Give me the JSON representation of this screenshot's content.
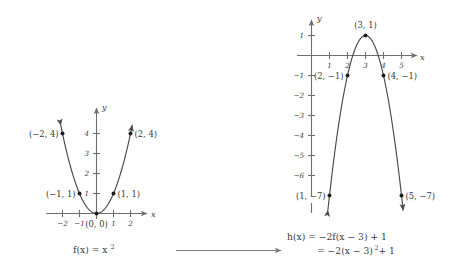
{
  "figure": {
    "background_color": "#ffffff",
    "ink_color": "#3a3a3a",
    "axis_color": "#6e6e6e",
    "curve_color": "#4a4a4a",
    "point_color": "#1d1d1d"
  },
  "chart_data": [
    {
      "id": "parent-parabola",
      "type": "line",
      "title": "f(x) = x^2",
      "caption": "f(x) = x²",
      "xlabel": "x",
      "ylabel": "y",
      "xlim": [
        -2.6,
        2.9
      ],
      "ylim": [
        -0.6,
        5.2
      ],
      "grid": false,
      "legend": "none",
      "equation": "f(x) = x^2",
      "x_ticks": [
        -2,
        -1,
        1,
        2
      ],
      "x_tick_labels": [
        "−2",
        "−1",
        "1",
        "2"
      ],
      "y_ticks": [
        1,
        2,
        3,
        4
      ],
      "y_tick_labels": [
        "1",
        "2",
        "3",
        "4"
      ],
      "x": [
        -2,
        -1,
        0,
        1,
        2
      ],
      "values": [
        4,
        1,
        0,
        1,
        4
      ],
      "points": [
        {
          "x": -2,
          "y": 4,
          "label": "(−2, 4)",
          "label_side": "left"
        },
        {
          "x": -1,
          "y": 1,
          "label": "(−1, 1)",
          "label_side": "left"
        },
        {
          "x": 0,
          "y": 0,
          "label": "(0, 0)",
          "label_side": "below"
        },
        {
          "x": 1,
          "y": 1,
          "label": "(1, 1)",
          "label_side": "right"
        },
        {
          "x": 2,
          "y": 4,
          "label": "(2, 4)",
          "label_side": "right"
        }
      ]
    },
    {
      "id": "transformed-parabola",
      "type": "line",
      "title": "h(x) = -2f(x-3) + 1",
      "caption_line1": "h(x) = −2f(x − 3) + 1",
      "caption_line2": "= −2(x − 3)² + 1",
      "xlabel": "x",
      "ylabel": "y",
      "xlim": [
        -0.7,
        6.2
      ],
      "ylim": [
        -8.2,
        1.9
      ],
      "grid": false,
      "legend": "none",
      "equation": "h(x) = -2(x-3)^2 + 1",
      "x_ticks": [
        1,
        2,
        3,
        4,
        5
      ],
      "x_tick_labels": [
        "1",
        "2",
        "3",
        "4",
        "5"
      ],
      "y_ticks": [
        1,
        -1,
        -2,
        -3,
        -4,
        -5,
        -6
      ],
      "y_tick_labels": [
        "1",
        "−1",
        "−2",
        "−3",
        "−4",
        "−5",
        "−6"
      ],
      "x": [
        1,
        2,
        3,
        4,
        5
      ],
      "values": [
        -7,
        -1,
        1,
        -1,
        -7
      ],
      "points": [
        {
          "x": 1,
          "y": -7,
          "label": "(1, −7)",
          "label_side": "left"
        },
        {
          "x": 2,
          "y": -1,
          "label": "(2, −1)",
          "label_side": "left"
        },
        {
          "x": 3,
          "y": 1,
          "label": "(3, 1)",
          "label_side": "above"
        },
        {
          "x": 4,
          "y": -1,
          "label": "(4, −1)",
          "label_side": "right"
        },
        {
          "x": 5,
          "y": -7,
          "label": "(5, −7)",
          "label_side": "right"
        }
      ]
    }
  ],
  "left_plot": {
    "axis_x_label": "x",
    "axis_y_label": "y",
    "tick_x_m2": "−2",
    "tick_x_m1": "−1",
    "tick_x_1": "1",
    "tick_x_2": "2",
    "tick_y_1": "1",
    "tick_y_2": "2",
    "tick_y_3": "3",
    "tick_y_4": "4",
    "pt_m2_4": "(−2, 4)",
    "pt_m1_1": "(−1, 1)",
    "pt_0_0": "(0, 0)",
    "pt_1_1": "(1, 1)",
    "pt_2_4": "(2, 4)",
    "caption": "f(x) = x",
    "caption_exponent": "2"
  },
  "right_plot": {
    "axis_x_label": "x",
    "axis_y_label": "y",
    "tick_x_1": "1",
    "tick_x_2": "2",
    "tick_x_3": "3",
    "tick_x_4": "4",
    "tick_x_5": "5",
    "tick_y_1": "1",
    "tick_y_m1": "−1",
    "tick_y_m2": "−2",
    "tick_y_m3": "−3",
    "tick_y_m4": "−4",
    "tick_y_m5": "−5",
    "tick_y_m6": "−6",
    "pt_1_m7": "(1, −7)",
    "pt_2_m1": "(2, −1)",
    "pt_3_1": "(3, 1)",
    "pt_4_m1": "(4, −1)",
    "pt_5_m7": "(5, −7)",
    "caption_line1": "h(x) = −2f(x − 3) + 1",
    "caption_line2_prefix": "= −2(x − 3)",
    "caption_line2_exponent": "2",
    "caption_line2_suffix": "+ 1"
  },
  "connector": {
    "name": "transformation-arrow",
    "direction": "right"
  }
}
